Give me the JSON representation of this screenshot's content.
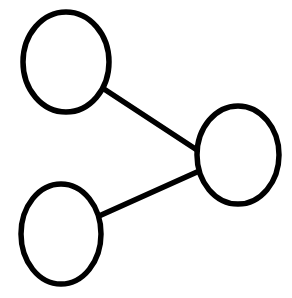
{
  "canvas": {
    "width": 292,
    "height": 298,
    "background_color": "#ffffff",
    "title": "node-link-diagram"
  },
  "style": {
    "node_stroke_color": "#000000",
    "node_fill_color": "none",
    "node_stroke_width": 5.5,
    "edge_stroke_color": "#000000",
    "edge_stroke_width": 5.5
  },
  "graph": {
    "node_count": 3,
    "edge_count": 2,
    "topology": "star",
    "nodes": [
      {
        "id": "node-top-left",
        "label": "",
        "shape": "ellipse",
        "cx": 66,
        "cy": 62,
        "rx": 43,
        "ry": 50
      },
      {
        "id": "node-right",
        "label": "",
        "shape": "ellipse",
        "cx": 238,
        "cy": 155,
        "rx": 41,
        "ry": 49
      },
      {
        "id": "node-bottom-left",
        "label": "",
        "shape": "ellipse",
        "cx": 61,
        "cy": 234,
        "rx": 40,
        "ry": 50
      }
    ],
    "edges": [
      {
        "id": "edge-top-left-to-right",
        "label": "",
        "source": "node-top-left",
        "target": "node-right",
        "x1": 104,
        "y1": 89,
        "x2": 197,
        "y2": 150
      },
      {
        "id": "edge-bottom-left-to-right",
        "label": "",
        "source": "node-bottom-left",
        "target": "node-right",
        "x1": 99,
        "y1": 216,
        "x2": 197,
        "y2": 172
      }
    ]
  }
}
